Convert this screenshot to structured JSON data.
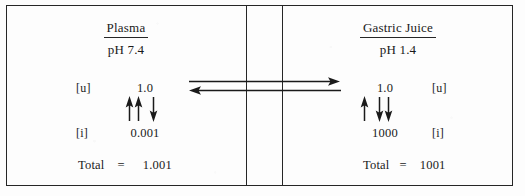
{
  "figure": {
    "frame_color": "#262626",
    "background_color": "#fdfdfd"
  },
  "compartments": {
    "left": {
      "name": "plasma",
      "title": "Plasma",
      "ph_label": "pH 7.4",
      "unionized": {
        "label": "[u]",
        "value": "1.0"
      },
      "ionized": {
        "label": "[i]",
        "value": "0.001"
      },
      "total": {
        "word": "Total",
        "equals": "=",
        "value": "1.001"
      }
    },
    "right": {
      "name": "gastric-juice",
      "title": "Gastric Juice",
      "ph_label": "pH 1.4",
      "unionized": {
        "label": "[u]",
        "value": "1.0"
      },
      "ionized": {
        "label": "[i]",
        "value": "1000"
      },
      "total": {
        "word": "Total",
        "equals": "=",
        "value": "1001"
      }
    }
  },
  "arrows": {
    "membrane_transport": [
      {
        "name": "arrow-plasma-to-gastric",
        "direction": "right",
        "y": 81
      },
      {
        "name": "arrow-gastric-to-plasma",
        "direction": "left",
        "y": 90
      }
    ],
    "plasma_equilibrium": [
      {
        "name": "plasma-ionization-up-arrow-1",
        "direction": "up"
      },
      {
        "name": "plasma-ionization-up-arrow-2",
        "direction": "up"
      },
      {
        "name": "plasma-ionization-down-arrow-1",
        "direction": "down"
      }
    ],
    "gastric_equilibrium": [
      {
        "name": "gastric-ionization-up-arrow-1",
        "direction": "up"
      },
      {
        "name": "gastric-ionization-down-arrow-1",
        "direction": "down"
      },
      {
        "name": "gastric-ionization-down-arrow-2",
        "direction": "down"
      }
    ]
  },
  "membrane": {
    "name": "membrane-barrier",
    "line_count": 2
  }
}
